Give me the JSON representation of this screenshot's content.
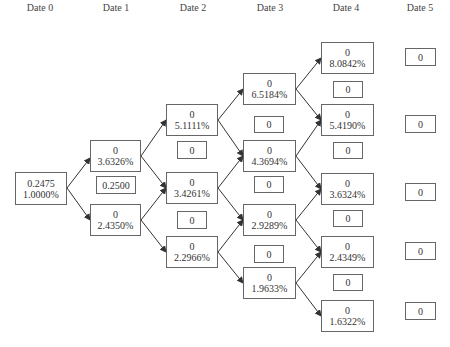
{
  "headers": [
    "Date 0",
    "Date 1",
    "Date 2",
    "Date 3",
    "Date 4",
    "Date 5"
  ],
  "colors": {
    "line": "#333333",
    "border": "#666666",
    "text": "#333333"
  },
  "nodes": {
    "d0": [
      {
        "value": "0.2475",
        "rate": "1.0000%"
      }
    ],
    "d1": [
      {
        "value": "0",
        "rate": "3.6326%"
      },
      {
        "value": "0",
        "rate": "2.4350%"
      }
    ],
    "d2": [
      {
        "value": "0",
        "rate": "5.1111%"
      },
      {
        "value": "0",
        "rate": "3.4261%"
      },
      {
        "value": "0",
        "rate": "2.2966%"
      }
    ],
    "d3": [
      {
        "value": "0",
        "rate": "6.5184%"
      },
      {
        "value": "0",
        "rate": "4.3694%"
      },
      {
        "value": "0",
        "rate": "2.9289%"
      },
      {
        "value": "0",
        "rate": "1.9633%"
      }
    ],
    "d4": [
      {
        "value": "0",
        "rate": "8.0842%"
      },
      {
        "value": "0",
        "rate": "5.4190%"
      },
      {
        "value": "0",
        "rate": "3.6324%"
      },
      {
        "value": "0",
        "rate": "2.4349%"
      },
      {
        "value": "0",
        "rate": "1.6322%"
      }
    ]
  },
  "cashflows": {
    "d1": [
      "0.2500"
    ],
    "d2": [
      "0",
      "0"
    ],
    "d3": [
      "0",
      "0",
      "0"
    ],
    "d4": [
      "0",
      "0",
      "0",
      "0"
    ],
    "d5": [
      "0",
      "0",
      "0",
      "0",
      "0"
    ]
  }
}
